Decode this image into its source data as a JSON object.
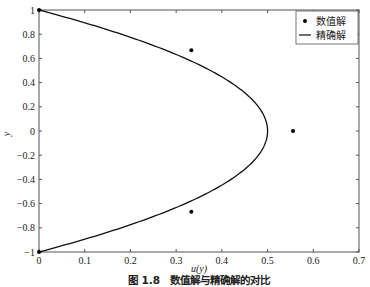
{
  "chart_data": {
    "type": "line",
    "title": "",
    "caption": "图 1.8　数值解与精确解的对比",
    "xlabel": "u(y)",
    "ylabel": "y",
    "xlim": [
      0,
      0.7
    ],
    "ylim": [
      -1,
      1
    ],
    "xticks": [
      0,
      0.1,
      0.2,
      0.3,
      0.4,
      0.5,
      0.6,
      0.7
    ],
    "xtick_labels": [
      "0",
      "0.1",
      "0.2",
      "0.3",
      "0.4",
      "0.5",
      "0.6",
      "0.7"
    ],
    "yticks": [
      1,
      0.8,
      0.6,
      0.4,
      0.2,
      0,
      -0.2,
      -0.4,
      -0.6,
      -0.8,
      -1
    ],
    "ytick_labels": [
      "1",
      "0.8",
      "0.6",
      "0.4",
      "0.2",
      "0",
      "−0.2",
      "−0.4",
      "−0.6",
      "−0.8",
      "−1"
    ],
    "grid": false,
    "legend_position": "top-right",
    "series": [
      {
        "name": "数值解",
        "kind": "scatter",
        "points": [
          {
            "u": 0,
            "y": 1
          },
          {
            "u": 0.3333,
            "y": 0.6667
          },
          {
            "u": 0.5556,
            "y": 0
          },
          {
            "u": 0.3333,
            "y": -0.6667
          },
          {
            "u": 0,
            "y": -1
          }
        ]
      },
      {
        "name": "精确解",
        "kind": "line",
        "formula": "u = (1 - y^2) / 2",
        "y_range": [
          -1,
          1
        ]
      }
    ]
  }
}
